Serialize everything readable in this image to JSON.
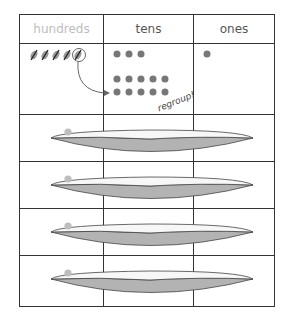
{
  "diagram": {
    "title": "",
    "columns": [
      {
        "label": "hundreds",
        "dimmed": true
      },
      {
        "label": "tens",
        "dimmed": false
      },
      {
        "label": "ones",
        "dimmed": false
      }
    ],
    "first_row": {
      "hundreds": {
        "crossed_out_count": 5,
        "circled_index": 4
      },
      "tens": {
        "dots_original": 3,
        "dots_regrouped": 10
      },
      "ones": {
        "dots": 1
      }
    },
    "annotation": "regroup!",
    "boat_rows": 4,
    "colors": {
      "grid": "#333333",
      "dot": "#777777",
      "boat_dot": "#bdbdbd",
      "boat_hull": "#b3b3b3",
      "header_dim": "#bdbdbd",
      "header": "#555555"
    }
  }
}
